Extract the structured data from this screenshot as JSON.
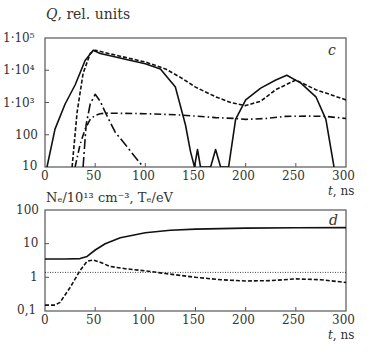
{
  "chart_data": [
    {
      "panel": "c",
      "type": "line",
      "title": "Q, rel. units",
      "xlabel": "t, ns",
      "ylabel": "Q, rel. units",
      "yscale": "log",
      "xlim": [
        0,
        300
      ],
      "ylim": [
        10,
        100000
      ],
      "x_ticks": [
        "0",
        "50",
        "100",
        "150",
        "200",
        "250",
        "300"
      ],
      "y_ticks": [
        "10",
        "100",
        "1·10³",
        "1·10⁴",
        "1·10⁵"
      ],
      "grid": false,
      "legend": "none",
      "series": [
        {
          "name": "solid",
          "style": "solid",
          "x": [
            2,
            10,
            20,
            30,
            40,
            48,
            55,
            65,
            80,
            100,
            115,
            130,
            140,
            145,
            149,
            152,
            155,
            158,
            165,
            170,
            175,
            183,
            190,
            200,
            215,
            230,
            241,
            255,
            270,
            280,
            288
          ],
          "y": [
            10,
            150,
            900,
            3500,
            20000,
            42000,
            33000,
            28000,
            22000,
            16000,
            11000,
            3000,
            200,
            30,
            10,
            35,
            10,
            10,
            10,
            35,
            10,
            10,
            300,
            1200,
            2800,
            5000,
            7000,
            4000,
            1500,
            300,
            10
          ]
        },
        {
          "name": "dashed",
          "style": "dashed",
          "x": [
            27,
            32,
            38,
            45,
            50,
            60,
            80,
            100,
            120,
            135,
            150,
            170,
            185,
            200,
            215,
            230,
            250,
            270,
            300
          ],
          "y": [
            10,
            500,
            8000,
            33000,
            42000,
            35000,
            25000,
            18000,
            11000,
            6000,
            3000,
            1500,
            1000,
            800,
            1100,
            2500,
            5000,
            2500,
            1200
          ]
        },
        {
          "name": "long-dash-dot (peak)",
          "style": "dashdot-long",
          "x": [
            38,
            41,
            45,
            50,
            55,
            60,
            70,
            80,
            90,
            98
          ],
          "y": [
            10,
            200,
            900,
            1800,
            1100,
            500,
            120,
            50,
            20,
            10
          ]
        },
        {
          "name": "dash-dot",
          "style": "dashdot",
          "x": [
            30,
            35,
            40,
            45,
            50,
            55,
            60,
            80,
            100,
            130,
            150,
            170,
            190,
            200,
            220,
            240,
            260,
            280,
            300
          ],
          "y": [
            10,
            50,
            150,
            300,
            400,
            450,
            470,
            460,
            450,
            420,
            380,
            340,
            320,
            300,
            320,
            370,
            380,
            370,
            320
          ]
        }
      ],
      "annotations": [
        "c"
      ]
    },
    {
      "panel": "d",
      "type": "line",
      "title": "Nₑ/10¹³ cm⁻³, Tₑ/eV",
      "xlabel": "t, ns",
      "ylabel": "Nₑ/10¹³ cm⁻³, Tₑ/eV",
      "yscale": "log",
      "xlim": [
        0,
        300
      ],
      "ylim": [
        0.1,
        100
      ],
      "x_ticks": [
        "0",
        "50",
        "100",
        "150",
        "200",
        "250",
        "300"
      ],
      "y_ticks": [
        "0,1",
        "1",
        "10",
        "100"
      ],
      "grid": false,
      "legend": "none",
      "series": [
        {
          "name": "solid (Nₑ)",
          "style": "solid",
          "x": [
            0,
            20,
            35,
            42,
            50,
            60,
            75,
            100,
            125,
            150,
            175,
            200,
            250,
            300
          ],
          "y": [
            3.5,
            3.5,
            3.6,
            4.2,
            6.5,
            10,
            15,
            21,
            25,
            27,
            28,
            29,
            29.5,
            30
          ]
        },
        {
          "name": "dashed (Tₑ)",
          "style": "dashed",
          "x": [
            0,
            10,
            15,
            25,
            35,
            42,
            48,
            55,
            65,
            80,
            100,
            120,
            150,
            175,
            200,
            225,
            250,
            275,
            300
          ],
          "y": [
            0.15,
            0.15,
            0.18,
            0.5,
            1.6,
            3.0,
            3.3,
            2.8,
            2.1,
            1.8,
            1.55,
            1.3,
            1.0,
            0.85,
            0.78,
            0.8,
            0.9,
            0.85,
            0.7
          ]
        },
        {
          "name": "dotted reference",
          "style": "dotted",
          "x": [
            0,
            300
          ],
          "y": [
            1.4,
            1.4
          ]
        }
      ],
      "annotations": [
        "d"
      ]
    }
  ],
  "labels": {
    "top_ylabel_q": "Q",
    "top_ylabel_rest": ", rel. units",
    "panel_c": "c",
    "panel_d": "d",
    "xlabel_t": "t",
    "xlabel_unit": ", ns",
    "bottom_ylabel": "Nₑ/10¹³ cm⁻³, Tₑ/eV",
    "top_yticks": [
      "1·10⁵",
      "1·10⁴",
      "1·10³",
      "100",
      "10"
    ],
    "bottom_yticks": [
      "100",
      "10",
      "1",
      "0,1"
    ],
    "xticks": [
      "0",
      "50",
      "100",
      "150",
      "200",
      "250",
      "300"
    ]
  }
}
